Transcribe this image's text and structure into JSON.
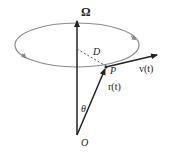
{
  "diagram": {
    "labels": {
      "omega": "Ω",
      "distance": "D",
      "point": "P",
      "velocity": "v(t)",
      "position": "r(t)",
      "angle": "θ",
      "origin": "O"
    },
    "colors": {
      "axis": "#222222",
      "orbit": "#888888",
      "dashed": "#555555",
      "text": "#222222"
    }
  }
}
